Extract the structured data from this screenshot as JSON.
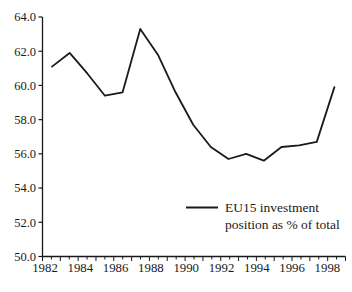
{
  "chart_data": {
    "type": "line",
    "title": "",
    "xlabel": "",
    "ylabel": "",
    "x": [
      1982,
      1983,
      1984,
      1985,
      1986,
      1987,
      1988,
      1989,
      1990,
      1991,
      1992,
      1993,
      1994,
      1995,
      1996,
      1997,
      1998
    ],
    "series": [
      {
        "name": "EU15 investment position as % of total",
        "values": [
          61.1,
          61.9,
          60.7,
          59.4,
          59.6,
          63.3,
          61.8,
          59.6,
          57.7,
          56.4,
          55.7,
          56.0,
          55.6,
          56.4,
          56.5,
          56.7,
          59.9
        ]
      }
    ],
    "ylim": [
      50.0,
      64.0
    ],
    "ytick_step": 2.0,
    "ytick_labels": [
      "64.0",
      "62.0",
      "60.0",
      "58.0",
      "56.0",
      "54.0",
      "52.0",
      "50.0"
    ],
    "xtick_labels": [
      "1982",
      "1984",
      "1986",
      "1988",
      "1990",
      "1992",
      "1994",
      "1996",
      "1998"
    ],
    "legend": {
      "swatch": "line",
      "lines": [
        "EU15 investment",
        "position as % of total"
      ],
      "position": "bottom-right"
    },
    "grid": false,
    "line_color": "#1a1a1a",
    "axis_color": "#1a1a1a",
    "background": "#ffffff"
  }
}
